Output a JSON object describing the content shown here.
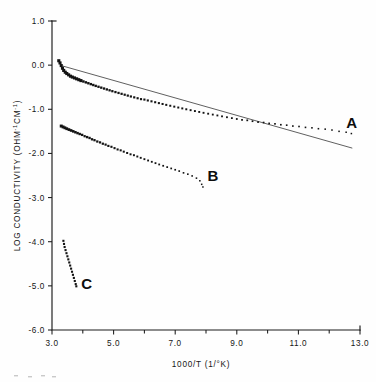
{
  "figure": {
    "background_color": "#fefefe",
    "ink_color": "#131313"
  },
  "chart_data": {
    "type": "scatter",
    "title": "",
    "xlabel": "1000/T (1/°K)",
    "ylabel": "LOG CONDUCTIVITY (OHM⁻¹CM⁻¹)",
    "ylabel_parts": {
      "main": "LOG CONDUCTIVITY  (OHM",
      "sup1": "-1",
      "mid": "CM",
      "sup2": "-1",
      "tail": ")"
    },
    "xlim": [
      3.0,
      13.0
    ],
    "ylim": [
      -6.0,
      1.0
    ],
    "grid": false,
    "legend": "none",
    "x_ticks_major": [
      3.0,
      5.0,
      7.0,
      9.0,
      11.0,
      13.0
    ],
    "x_tick_labels": [
      "3.0",
      "5.0",
      "7.0",
      "9.0",
      "11.0",
      "13.0"
    ],
    "x_ticks_minor": [
      4.0,
      6.0,
      8.0,
      10.0,
      12.0
    ],
    "y_ticks_major": [
      1.0,
      0.0,
      -1.0,
      -2.0,
      -3.0,
      -4.0,
      -5.0,
      -6.0
    ],
    "y_tick_labels": [
      "1.0",
      "0.0",
      "-1.0",
      "-2.0",
      "-3.0",
      "-4.0",
      "-5.0",
      "-6.0"
    ],
    "series": [
      {
        "name": "A",
        "label": "A",
        "label_x": 12.55,
        "label_y": -1.43,
        "marker": "square",
        "has_fit_line": true,
        "fit_line": {
          "x0": 3.35,
          "y0": -0.02,
          "x1": 12.75,
          "y1": -1.88
        },
        "points": [
          [
            3.22,
            0.1
          ],
          [
            3.26,
            0.05
          ],
          [
            3.3,
            -0.01
          ],
          [
            3.34,
            -0.07
          ],
          [
            3.38,
            -0.12
          ],
          [
            3.43,
            -0.16
          ],
          [
            3.48,
            -0.19
          ],
          [
            3.54,
            -0.22
          ],
          [
            3.6,
            -0.25
          ],
          [
            3.66,
            -0.27
          ],
          [
            3.73,
            -0.29
          ],
          [
            3.8,
            -0.31
          ],
          [
            3.87,
            -0.33
          ],
          [
            3.94,
            -0.35
          ],
          [
            4.02,
            -0.37
          ],
          [
            4.1,
            -0.39
          ],
          [
            4.18,
            -0.41
          ],
          [
            4.26,
            -0.43
          ],
          [
            4.34,
            -0.45
          ],
          [
            4.42,
            -0.47
          ],
          [
            4.51,
            -0.49
          ],
          [
            4.6,
            -0.51
          ],
          [
            4.69,
            -0.53
          ],
          [
            4.78,
            -0.55
          ],
          [
            4.87,
            -0.57
          ],
          [
            4.96,
            -0.59
          ],
          [
            5.06,
            -0.61
          ],
          [
            5.16,
            -0.63
          ],
          [
            5.26,
            -0.65
          ],
          [
            5.36,
            -0.67
          ],
          [
            5.46,
            -0.69
          ],
          [
            5.56,
            -0.71
          ],
          [
            5.67,
            -0.73
          ],
          [
            5.78,
            -0.75
          ],
          [
            5.89,
            -0.77
          ],
          [
            6.0,
            -0.78
          ],
          [
            6.11,
            -0.8
          ],
          [
            6.23,
            -0.82
          ],
          [
            6.35,
            -0.84
          ],
          [
            6.47,
            -0.86
          ],
          [
            6.59,
            -0.88
          ],
          [
            6.71,
            -0.9
          ],
          [
            6.84,
            -0.92
          ],
          [
            6.97,
            -0.94
          ],
          [
            7.1,
            -0.96
          ],
          [
            7.23,
            -0.98
          ],
          [
            7.36,
            -1.0
          ],
          [
            7.5,
            -1.02
          ],
          [
            7.64,
            -1.04
          ],
          [
            7.78,
            -1.06
          ],
          [
            7.92,
            -1.08
          ],
          [
            8.07,
            -1.1
          ],
          [
            8.22,
            -1.12
          ],
          [
            8.37,
            -1.14
          ],
          [
            8.52,
            -1.16
          ],
          [
            8.68,
            -1.18
          ],
          [
            8.84,
            -1.2
          ],
          [
            9.0,
            -1.22
          ],
          [
            9.17,
            -1.24
          ],
          [
            9.34,
            -1.25
          ],
          [
            9.51,
            -1.27
          ],
          [
            9.69,
            -1.29
          ],
          [
            9.87,
            -1.3
          ],
          [
            10.05,
            -1.32
          ],
          [
            10.24,
            -1.33
          ],
          [
            10.43,
            -1.35
          ],
          [
            10.62,
            -1.36
          ],
          [
            10.82,
            -1.38
          ],
          [
            11.02,
            -1.39
          ],
          [
            11.23,
            -1.41
          ],
          [
            11.44,
            -1.42
          ],
          [
            11.65,
            -1.44
          ],
          [
            11.87,
            -1.45
          ],
          [
            12.09,
            -1.47
          ],
          [
            12.32,
            -1.5
          ],
          [
            12.55,
            -1.52
          ],
          [
            12.72,
            -1.55
          ]
        ]
      },
      {
        "name": "B",
        "label": "B",
        "label_x": 8.05,
        "label_y": -2.62,
        "marker": "square",
        "has_fit_line": false,
        "points": [
          [
            3.3,
            -1.38
          ],
          [
            3.36,
            -1.4
          ],
          [
            3.42,
            -1.42
          ],
          [
            3.48,
            -1.44
          ],
          [
            3.55,
            -1.46
          ],
          [
            3.62,
            -1.48
          ],
          [
            3.69,
            -1.5
          ],
          [
            3.76,
            -1.52
          ],
          [
            3.83,
            -1.54
          ],
          [
            3.9,
            -1.56
          ],
          [
            3.98,
            -1.58
          ],
          [
            4.06,
            -1.61
          ],
          [
            4.14,
            -1.63
          ],
          [
            4.22,
            -1.65
          ],
          [
            4.3,
            -1.68
          ],
          [
            4.38,
            -1.7
          ],
          [
            4.47,
            -1.73
          ],
          [
            4.56,
            -1.75
          ],
          [
            4.65,
            -1.78
          ],
          [
            4.74,
            -1.8
          ],
          [
            4.83,
            -1.83
          ],
          [
            4.93,
            -1.85
          ],
          [
            5.03,
            -1.88
          ],
          [
            5.13,
            -1.91
          ],
          [
            5.23,
            -1.93
          ],
          [
            5.33,
            -1.96
          ],
          [
            5.44,
            -1.99
          ],
          [
            5.55,
            -2.02
          ],
          [
            5.66,
            -2.04
          ],
          [
            5.77,
            -2.07
          ],
          [
            5.88,
            -2.1
          ],
          [
            6.0,
            -2.13
          ],
          [
            6.12,
            -2.16
          ],
          [
            6.24,
            -2.19
          ],
          [
            6.36,
            -2.22
          ],
          [
            6.48,
            -2.25
          ],
          [
            6.61,
            -2.28
          ],
          [
            6.74,
            -2.31
          ],
          [
            6.87,
            -2.34
          ],
          [
            7.0,
            -2.37
          ],
          [
            7.13,
            -2.4
          ],
          [
            7.27,
            -2.44
          ],
          [
            7.41,
            -2.47
          ],
          [
            7.55,
            -2.51
          ],
          [
            7.69,
            -2.56
          ],
          [
            7.8,
            -2.62
          ],
          [
            7.86,
            -2.7
          ],
          [
            7.9,
            -2.76
          ]
        ]
      },
      {
        "name": "C",
        "label": "C",
        "label_x": 3.95,
        "label_y": -5.08,
        "marker": "square",
        "has_fit_line": false,
        "points": [
          [
            3.37,
            -3.98
          ],
          [
            3.39,
            -4.05
          ],
          [
            3.41,
            -4.12
          ],
          [
            3.44,
            -4.19
          ],
          [
            3.47,
            -4.26
          ],
          [
            3.5,
            -4.33
          ],
          [
            3.53,
            -4.4
          ],
          [
            3.56,
            -4.47
          ],
          [
            3.59,
            -4.54
          ],
          [
            3.62,
            -4.61
          ],
          [
            3.65,
            -4.68
          ],
          [
            3.68,
            -4.75
          ],
          [
            3.71,
            -4.82
          ],
          [
            3.74,
            -4.89
          ],
          [
            3.77,
            -4.96
          ],
          [
            3.79,
            -5.01
          ]
        ]
      }
    ]
  }
}
